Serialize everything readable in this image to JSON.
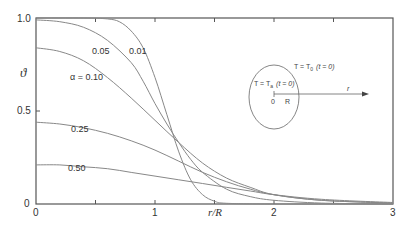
{
  "chart_data": {
    "type": "line",
    "title": "",
    "xlabel": "r/R",
    "ylabel": "ϑ",
    "xlim": [
      0,
      3
    ],
    "ylim": [
      0,
      1
    ],
    "xticks": [
      "0",
      "1",
      "2",
      "3"
    ],
    "yticks": [
      "0",
      "0.5",
      "1.0"
    ],
    "grid": false,
    "legend": "inline curve labels",
    "series": [
      {
        "name": "0.01",
        "label": "0.01",
        "x": [
          0,
          0.4,
          0.6,
          0.7,
          0.8,
          0.9,
          1.0,
          1.1,
          1.2,
          1.3,
          1.4,
          1.5,
          1.6,
          2.0,
          3.0
        ],
        "y": [
          1.0,
          1.0,
          0.995,
          0.98,
          0.93,
          0.84,
          0.68,
          0.48,
          0.28,
          0.13,
          0.05,
          0.015,
          0.004,
          0.0,
          0.0
        ]
      },
      {
        "name": "0.05",
        "label": "0.05",
        "x": [
          0,
          0.2,
          0.4,
          0.6,
          0.8,
          0.9,
          1.0,
          1.1,
          1.2,
          1.3,
          1.4,
          1.6,
          1.8,
          2.0,
          2.4,
          3.0
        ],
        "y": [
          0.99,
          0.98,
          0.95,
          0.88,
          0.76,
          0.66,
          0.54,
          0.43,
          0.33,
          0.24,
          0.17,
          0.08,
          0.04,
          0.02,
          0.005,
          0.0
        ]
      },
      {
        "name": "α = 0.10",
        "label": "α = 0.10",
        "x": [
          0,
          0.2,
          0.4,
          0.6,
          0.8,
          1.0,
          1.2,
          1.4,
          1.6,
          1.8,
          2.0,
          2.4,
          3.0
        ],
        "y": [
          0.84,
          0.82,
          0.77,
          0.68,
          0.57,
          0.45,
          0.33,
          0.22,
          0.14,
          0.09,
          0.05,
          0.02,
          0.005
        ]
      },
      {
        "name": "0.25",
        "label": "0.25",
        "x": [
          0,
          0.2,
          0.4,
          0.6,
          0.8,
          1.0,
          1.2,
          1.4,
          1.6,
          1.8,
          2.0,
          2.4,
          3.0
        ],
        "y": [
          0.44,
          0.43,
          0.41,
          0.38,
          0.34,
          0.29,
          0.23,
          0.17,
          0.12,
          0.08,
          0.05,
          0.02,
          0.005
        ]
      },
      {
        "name": "0.50",
        "label": "0.50",
        "x": [
          0,
          0.2,
          0.4,
          0.6,
          0.8,
          1.0,
          1.2,
          1.4,
          1.6,
          1.8,
          2.0,
          2.4,
          3.0
        ],
        "y": [
          0.21,
          0.21,
          0.2,
          0.19,
          0.17,
          0.15,
          0.13,
          0.11,
          0.09,
          0.07,
          0.05,
          0.025,
          0.008
        ]
      }
    ],
    "annotations": [
      "T = T0 (t = 0)",
      "T = Ta (t = 0)",
      "0",
      "R",
      "r"
    ]
  },
  "labels": {
    "curve_001": "0.01",
    "curve_005": "0.05",
    "curve_010": "α = 0.10",
    "curve_025": "0.25",
    "curve_050": "0.50"
  },
  "axes": {
    "xlabel": "r/R",
    "ylabel": "ϑ",
    "x_tick_0": "0",
    "x_tick_1": "1",
    "x_tick_2": "2",
    "x_tick_3": "3",
    "y_tick_0": "0",
    "y_tick_05": "0.5",
    "y_tick_1": "1.0"
  },
  "inset": {
    "outside": "T = T",
    "outside_sub": "0",
    "outside_time": "(t = 0)",
    "inside": "T = T",
    "inside_sub": "a",
    "inside_time": "(t = 0)",
    "origin": "0",
    "radius": "R",
    "axis": "r"
  },
  "colors": {
    "axis": "#555555",
    "curve": "#888888",
    "text": "#333333"
  }
}
